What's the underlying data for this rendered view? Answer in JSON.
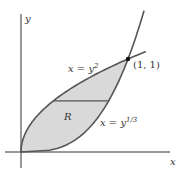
{
  "figure": {
    "axis_x_label": "x",
    "axis_y_label": "y",
    "curve_upper_label_base": "x = y",
    "curve_upper_label_exp": "2",
    "curve_lower_label_base": "x = y",
    "curve_lower_label_exp": "1/3",
    "region_label": "R",
    "intersection_label": "(1, 1)",
    "region_fill_color": "#d9d9d9",
    "curve_color": "#555555",
    "axis_color": "#333333",
    "intersection": [
      1,
      1
    ],
    "strip_y": 0.55
  }
}
